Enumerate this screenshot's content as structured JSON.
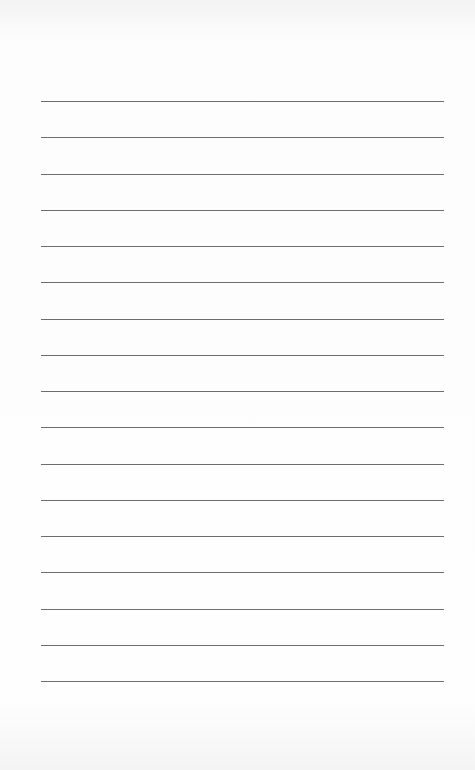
{
  "page": {
    "type": "blank lined paper",
    "line_count": 17,
    "line_color": "#6e6e6e",
    "background_color": "#fdfdfd",
    "first_line_y": 101,
    "line_spacing": 36.25,
    "line_left": 41,
    "line_width": 403
  }
}
